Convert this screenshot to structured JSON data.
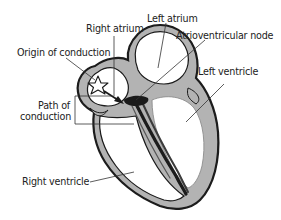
{
  "diagram": {
    "type": "anatomical-diagram",
    "colors": {
      "background": "#ffffff",
      "wall_fill": "#b3b3b3",
      "outline": "#1a1a1a",
      "conduction_path": "#2a2a2a",
      "leader_line": "#333333",
      "text": "#222222"
    },
    "labels": {
      "left_atrium": "Left atrium",
      "right_atrium": "Right atrium",
      "origin_of_conduction": "Origin of conduction",
      "atrioventricular_node": "Atrioventricular node",
      "left_ventricle": "Left ventricle",
      "path_of_conduction_line1": "Path of",
      "path_of_conduction_line2": "conduction",
      "right_ventricle": "Right ventricle"
    },
    "icons": {
      "origin": "star-icon",
      "direction": "arrow-icon"
    }
  }
}
